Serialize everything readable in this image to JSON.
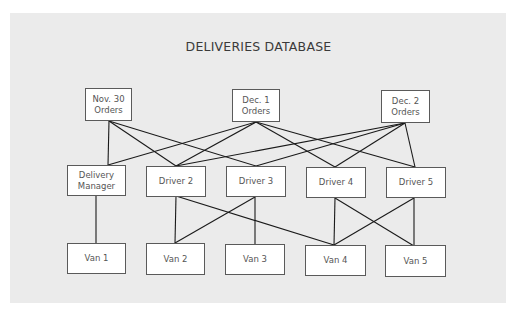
{
  "title": "DELIVERIES DATABASE",
  "colors": {
    "panel": "#ebebeb",
    "box_border": "#5a5a5a",
    "line": "#1a1a1a",
    "text": "#555555"
  },
  "top_row": [
    {
      "id": "nov30",
      "line1": "Nov. 30",
      "line2": "Orders"
    },
    {
      "id": "dec1",
      "line1": "Dec. 1",
      "line2": "Orders"
    },
    {
      "id": "dec2",
      "line1": "Dec. 2",
      "line2": "Orders"
    }
  ],
  "middle_row": [
    {
      "id": "dm",
      "line1": "Delivery",
      "line2": "Manager"
    },
    {
      "id": "d2",
      "line1": "Driver 2",
      "line2": ""
    },
    {
      "id": "d3",
      "line1": "Driver 3",
      "line2": ""
    },
    {
      "id": "d4",
      "line1": "Driver 4",
      "line2": ""
    },
    {
      "id": "d5",
      "line1": "Driver 5",
      "line2": ""
    }
  ],
  "bottom_row": [
    {
      "id": "v1",
      "label": "Van 1"
    },
    {
      "id": "v2",
      "label": "Van 2"
    },
    {
      "id": "v3",
      "label": "Van 3"
    },
    {
      "id": "v4",
      "label": "Van 4"
    },
    {
      "id": "v5",
      "label": "Van 5"
    }
  ],
  "edges": [
    [
      "nov30",
      "dm"
    ],
    [
      "nov30",
      "d2"
    ],
    [
      "nov30",
      "d3"
    ],
    [
      "dec1",
      "dm"
    ],
    [
      "dec1",
      "d2"
    ],
    [
      "dec1",
      "d4"
    ],
    [
      "dec1",
      "d5"
    ],
    [
      "dec2",
      "d2"
    ],
    [
      "dec2",
      "d3"
    ],
    [
      "dec2",
      "d4"
    ],
    [
      "dec2",
      "d5"
    ],
    [
      "dm",
      "v1"
    ],
    [
      "d2",
      "v2"
    ],
    [
      "d2",
      "v4"
    ],
    [
      "d3",
      "v2"
    ],
    [
      "d3",
      "v3"
    ],
    [
      "d4",
      "v4"
    ],
    [
      "d4",
      "v5"
    ],
    [
      "d5",
      "v4"
    ],
    [
      "d5",
      "v5"
    ]
  ]
}
